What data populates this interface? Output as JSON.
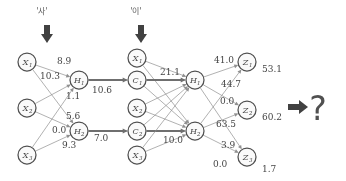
{
  "figure": {
    "type": "neural-network-diagram",
    "title": "",
    "ink_color": "#4a4a4a",
    "edge_color": "#8e8e8e"
  },
  "top_inputs": [
    {
      "name": "input-syllable-1",
      "text": "'사'",
      "x": 42,
      "y": 14
    },
    {
      "name": "input-syllable-2",
      "text": "'이'",
      "x": 136,
      "y": 14
    }
  ],
  "nodes": {
    "input_layer": [
      {
        "id": "X1",
        "base": "X",
        "sub": "1",
        "cx": 27,
        "cy": 62
      },
      {
        "id": "X2",
        "base": "X",
        "sub": "2",
        "cx": 27,
        "cy": 108
      },
      {
        "id": "X3",
        "base": "X",
        "sub": "3",
        "cx": 27,
        "cy": 155
      }
    ],
    "hidden_layer_1": [
      {
        "id": "H1",
        "base": "H",
        "sub": "1",
        "cx": 79,
        "cy": 80
      },
      {
        "id": "H2",
        "base": "H",
        "sub": "2",
        "cx": 79,
        "cy": 131
      }
    ],
    "second_stage_inputs": [
      {
        "id": "X1b",
        "base": "X",
        "sub": "1",
        "cx": 137,
        "cy": 58
      },
      {
        "id": "C1",
        "base": "C",
        "sub": "1",
        "cx": 137,
        "cy": 80
      },
      {
        "id": "X2b",
        "base": "X",
        "sub": "2",
        "cx": 137,
        "cy": 108
      },
      {
        "id": "C2",
        "base": "C",
        "sub": "2",
        "cx": 137,
        "cy": 131
      },
      {
        "id": "X3b",
        "base": "X",
        "sub": "3",
        "cx": 137,
        "cy": 155
      }
    ],
    "hidden_layer_2": [
      {
        "id": "H1b",
        "base": "H",
        "sub": "1",
        "cx": 195,
        "cy": 80
      },
      {
        "id": "H2b",
        "base": "H",
        "sub": "2",
        "cx": 195,
        "cy": 131
      }
    ],
    "output_layer": [
      {
        "id": "Z1",
        "base": "Z",
        "sub": "1",
        "cx": 247,
        "cy": 62
      },
      {
        "id": "Z2",
        "base": "Z",
        "sub": "2",
        "cx": 247,
        "cy": 110
      },
      {
        "id": "Z3",
        "base": "Z",
        "sub": "3",
        "cx": 247,
        "cy": 157
      }
    ]
  },
  "weight_labels": [
    {
      "name": "weight-89",
      "text": "8.9",
      "x": 57,
      "y": 64
    },
    {
      "name": "weight-103",
      "text": "10.3",
      "x": 40,
      "y": 79
    },
    {
      "name": "weight-11",
      "text": "1.1",
      "x": 66,
      "y": 99
    },
    {
      "name": "weight-106",
      "text": "10.6",
      "x": 92,
      "y": 93
    },
    {
      "name": "weight-56",
      "text": "5.6",
      "x": 66,
      "y": 119
    },
    {
      "name": "weight-00a",
      "text": "0.0",
      "x": 52,
      "y": 133
    },
    {
      "name": "weight-93",
      "text": "9.3",
      "x": 62,
      "y": 148
    },
    {
      "name": "weight-70",
      "text": "7.0",
      "x": 94,
      "y": 141
    },
    {
      "name": "weight-211",
      "text": "21.1",
      "x": 160,
      "y": 75
    },
    {
      "name": "weight-100",
      "text": "10.0",
      "x": 163,
      "y": 143
    },
    {
      "name": "weight-410",
      "text": "41.0",
      "x": 214,
      "y": 63
    },
    {
      "name": "weight-447",
      "text": "44.7",
      "x": 221,
      "y": 87
    },
    {
      "name": "weight-00b",
      "text": "0.0",
      "x": 220,
      "y": 104
    },
    {
      "name": "weight-635",
      "text": "63.5",
      "x": 216,
      "y": 127
    },
    {
      "name": "weight-39",
      "text": "3.9",
      "x": 221,
      "y": 148
    },
    {
      "name": "weight-00c",
      "text": "0.0",
      "x": 213,
      "y": 167
    }
  ],
  "output_values": [
    {
      "name": "output-value-z1",
      "text": "53.1",
      "x": 262,
      "y": 72
    },
    {
      "name": "output-value-z2",
      "text": "60.2",
      "x": 262,
      "y": 120
    },
    {
      "name": "output-value-z3",
      "text": "1.7",
      "x": 262,
      "y": 172
    }
  ],
  "result": {
    "arrow_name": "result-arrow-icon",
    "question_mark": "?"
  },
  "chart_data": {
    "type": "diagram",
    "layers": [
      "X1,X2,X3",
      "H1,H2",
      "X1,C1,X2,C2,X3",
      "H1,H2",
      "Z1,Z2,Z3"
    ],
    "output_values": [
      53.1,
      60.2,
      1.7
    ]
  }
}
